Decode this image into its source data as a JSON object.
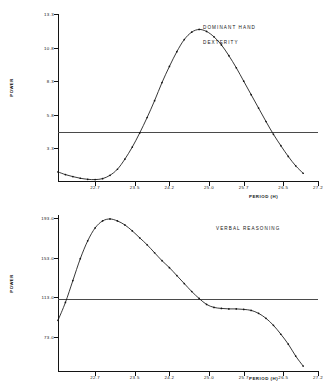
{
  "figure": {
    "axis_title_x": "PERIOD (H)",
    "axis_title_y": "POWER"
  },
  "chart_data": [
    {
      "type": "line",
      "title": "DOMINANT  HAND",
      "subtitle": "DEXTERITY",
      "xlabel": "PERIOD (H)",
      "ylabel": "POWER",
      "xlim": [
        21.95,
        27.2
      ],
      "ylim": [
        0.8,
        13.3
      ],
      "grid": false,
      "legend": "none",
      "xticks": [
        "22.7",
        "23.5",
        "24.2",
        "25.0",
        "25.7",
        "26.5",
        "27.2"
      ],
      "xtick_values": [
        22.7,
        23.5,
        24.2,
        25.0,
        25.7,
        26.5,
        27.2
      ],
      "yticks": [
        "13.3",
        "10.8",
        "8.3",
        "5.8",
        "3.3"
      ],
      "ytick_values": [
        13.3,
        10.8,
        8.3,
        5.8,
        3.3
      ],
      "threshold": 4.55,
      "threshold_label": "significance level",
      "x": [
        21.95,
        22.1,
        22.25,
        22.4,
        22.55,
        22.7,
        22.85,
        23.0,
        23.15,
        23.3,
        23.45,
        23.6,
        23.75,
        23.9,
        24.05,
        24.2,
        24.35,
        24.5,
        24.65,
        24.8,
        24.95,
        25.1,
        25.25,
        25.4,
        25.55,
        25.7,
        25.85,
        26.0,
        26.15,
        26.3,
        26.45,
        26.6,
        26.75,
        26.9
      ],
      "y": [
        1.55,
        1.35,
        1.2,
        1.08,
        1.0,
        0.98,
        1.05,
        1.3,
        1.75,
        2.5,
        3.4,
        4.45,
        5.6,
        6.85,
        8.2,
        9.4,
        10.5,
        11.4,
        11.95,
        12.15,
        12.0,
        11.6,
        11.0,
        10.2,
        9.3,
        8.3,
        7.3,
        6.3,
        5.3,
        4.35,
        3.5,
        2.7,
        2.0,
        1.45
      ]
    },
    {
      "type": "line",
      "title": "VERBAL  REASONING",
      "subtitle": "",
      "xlabel": "PERIOD (H)",
      "ylabel": "POWER",
      "xlim": [
        21.95,
        27.2
      ],
      "ylim": [
        38.0,
        196.0
      ],
      "grid": false,
      "legend": "none",
      "xticks": [
        "22.7",
        "23.5",
        "24.2",
        "25.0",
        "25.7",
        "26.5",
        "27.2"
      ],
      "xtick_values": [
        22.7,
        23.5,
        24.2,
        25.0,
        25.7,
        26.5,
        27.2
      ],
      "yticks": [
        "193.0",
        "153.0",
        "113.0",
        "73.0"
      ],
      "ytick_values": [
        193.0,
        153.0,
        113.0,
        73.0
      ],
      "threshold": 111.0,
      "threshold_label": "significance level",
      "x": [
        21.95,
        22.1,
        22.25,
        22.4,
        22.55,
        22.7,
        22.85,
        23.0,
        23.15,
        23.3,
        23.45,
        23.6,
        23.75,
        23.9,
        24.05,
        24.2,
        24.35,
        24.5,
        24.65,
        24.8,
        24.95,
        25.1,
        25.25,
        25.4,
        25.55,
        25.7,
        25.85,
        26.0,
        26.15,
        26.3,
        26.45,
        26.6,
        26.75,
        26.9
      ],
      "y": [
        90.0,
        108.0,
        130.0,
        152.0,
        170.0,
        183.0,
        190.0,
        192.0,
        190.0,
        186.0,
        180.0,
        173.0,
        166.0,
        158.0,
        150.0,
        143.0,
        135.0,
        127.0,
        119.0,
        112.0,
        106.0,
        103.0,
        102.0,
        101.5,
        101.5,
        101.0,
        100.0,
        97.0,
        92.0,
        85.0,
        76.0,
        66.0,
        54.0,
        44.0
      ]
    }
  ]
}
